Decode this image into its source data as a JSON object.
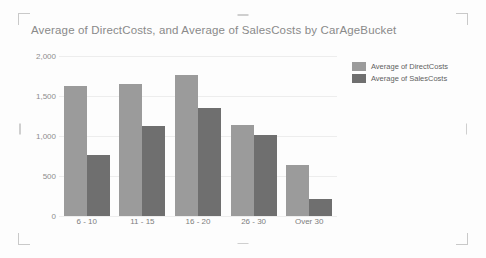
{
  "visual": {
    "name": "clustered-column-chart",
    "background": "#fdfdfd",
    "selected": true
  },
  "handles": {
    "top_left": "resize-handle-top-left",
    "top_right": "resize-handle-top-right",
    "bottom_left": "resize-handle-bottom-left",
    "bottom_right": "resize-handle-bottom-right",
    "top": "resize-handle-top",
    "bottom": "resize-handle-bottom",
    "left": "resize-handle-left",
    "right": "resize-handle-right"
  },
  "chart_data": {
    "type": "bar",
    "title": "Average of DirectCosts, and Average of SalesCosts by CarAgeBucket",
    "xlabel": "",
    "ylabel": "",
    "categories": [
      "6 - 10",
      "11 - 15",
      "16 - 20",
      "26 - 30",
      "Over 30"
    ],
    "series": [
      {
        "name": "Average of DirectCosts",
        "color": "#9b9b9b",
        "values": [
          1620,
          1650,
          1760,
          1135,
          635
        ]
      },
      {
        "name": "Average of SalesCosts",
        "color": "#6f6f6f",
        "values": [
          760,
          1120,
          1355,
          1010,
          210
        ]
      }
    ],
    "ylim": [
      0,
      2000
    ],
    "yticks": [
      0,
      500,
      1000,
      1500,
      2000
    ],
    "ytick_labels": [
      "0",
      "500",
      "1,000",
      "1,500",
      "2,000"
    ],
    "grid": true,
    "legend_position": "right",
    "legend_entries": [
      "Average of DirectCosts",
      "Average of SalesCosts"
    ]
  },
  "colors": {
    "title_text": "#8a8a8a",
    "axis_text": "#8d8d8d",
    "gridline": "#ededed",
    "handle": "#c9c9c9"
  }
}
